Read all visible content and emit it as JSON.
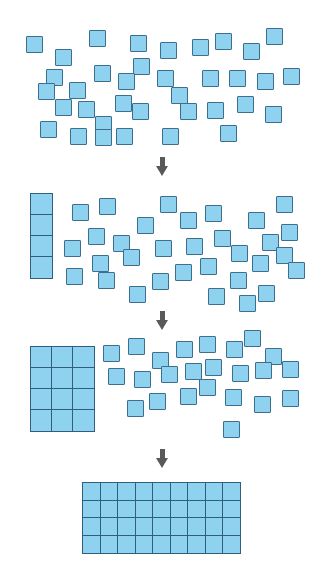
{
  "figure": {
    "type": "math-manipulative-diagram",
    "total_squares": 36,
    "square_fill_color": "#8ed2f0",
    "square_border_color": "#3d6e8e",
    "arrow_color": "#58595b",
    "background_color": "#ffffff"
  },
  "arrows": [
    {
      "name": "arrow-1",
      "glyph": "down-arrow",
      "label": ""
    },
    {
      "name": "arrow-2",
      "glyph": "down-arrow",
      "label": ""
    },
    {
      "name": "arrow-3",
      "glyph": "down-arrow",
      "label": ""
    }
  ],
  "stages": [
    {
      "id": "stage-1",
      "caption": "",
      "organized": {
        "rows": 0,
        "cols": 0,
        "count": 0
      },
      "loose_count": 36,
      "loose": [
        [
          26,
          36
        ],
        [
          89,
          30
        ],
        [
          55,
          49
        ],
        [
          130,
          35
        ],
        [
          160,
          42
        ],
        [
          192,
          39
        ],
        [
          133,
          58
        ],
        [
          215,
          33
        ],
        [
          243,
          43
        ],
        [
          266,
          28
        ],
        [
          94,
          65
        ],
        [
          171,
          87
        ],
        [
          202,
          70
        ],
        [
          229,
          70
        ],
        [
          257,
          73
        ],
        [
          283,
          68
        ],
        [
          46,
          69
        ],
        [
          118,
          73
        ],
        [
          69,
          82
        ],
        [
          38,
          83
        ],
        [
          157,
          70
        ],
        [
          78,
          101
        ],
        [
          115,
          95
        ],
        [
          55,
          99
        ],
        [
          132,
          103
        ],
        [
          95,
          116
        ],
        [
          180,
          103
        ],
        [
          237,
          96
        ],
        [
          207,
          102
        ],
        [
          265,
          106
        ],
        [
          40,
          121
        ],
        [
          70,
          128
        ],
        [
          116,
          128
        ],
        [
          162,
          128
        ],
        [
          95,
          129
        ],
        [
          220,
          125
        ]
      ]
    },
    {
      "id": "stage-2",
      "caption": "",
      "organized": {
        "rows": 4,
        "cols": 1,
        "count": 4
      },
      "loose_count": 32,
      "column_x": 31,
      "column_y": 194,
      "loose": [
        [
          72,
          204
        ],
        [
          99,
          198
        ],
        [
          137,
          217
        ],
        [
          88,
          228
        ],
        [
          113,
          235
        ],
        [
          64,
          240
        ],
        [
          92,
          255
        ],
        [
          123,
          249
        ],
        [
          155,
          240
        ],
        [
          66,
          268
        ],
        [
          98,
          272
        ],
        [
          129,
          286
        ],
        [
          152,
          273
        ],
        [
          160,
          196
        ],
        [
          180,
          212
        ],
        [
          186,
          238
        ],
        [
          200,
          258
        ],
        [
          175,
          264
        ],
        [
          205,
          205
        ],
        [
          214,
          230
        ],
        [
          231,
          245
        ],
        [
          230,
          272
        ],
        [
          248,
          212
        ],
        [
          252,
          255
        ],
        [
          262,
          234
        ],
        [
          258,
          285
        ],
        [
          276,
          196
        ],
        [
          281,
          224
        ],
        [
          276,
          247
        ],
        [
          288,
          262
        ],
        [
          208,
          288
        ],
        [
          239,
          295
        ]
      ]
    },
    {
      "id": "stage-3",
      "caption": "",
      "organized": {
        "rows": 4,
        "cols": 3,
        "count": 12
      },
      "loose_count": 24,
      "grid_x": 31,
      "grid_y": 347,
      "loose": [
        [
          103,
          345
        ],
        [
          128,
          338
        ],
        [
          152,
          352
        ],
        [
          176,
          341
        ],
        [
          199,
          336
        ],
        [
          226,
          341
        ],
        [
          244,
          330
        ],
        [
          265,
          348
        ],
        [
          108,
          368
        ],
        [
          134,
          371
        ],
        [
          161,
          366
        ],
        [
          185,
          363
        ],
        [
          205,
          359
        ],
        [
          232,
          365
        ],
        [
          255,
          362
        ],
        [
          282,
          361
        ],
        [
          127,
          400
        ],
        [
          180,
          388
        ],
        [
          149,
          393
        ],
        [
          199,
          379
        ],
        [
          225,
          389
        ],
        [
          254,
          396
        ],
        [
          282,
          390
        ],
        [
          223,
          421
        ]
      ]
    },
    {
      "id": "stage-4",
      "caption": "",
      "organized": {
        "rows": 4,
        "cols": 9,
        "count": 36
      },
      "loose_count": 0,
      "grid_x": 83,
      "grid_y": 483
    }
  ]
}
